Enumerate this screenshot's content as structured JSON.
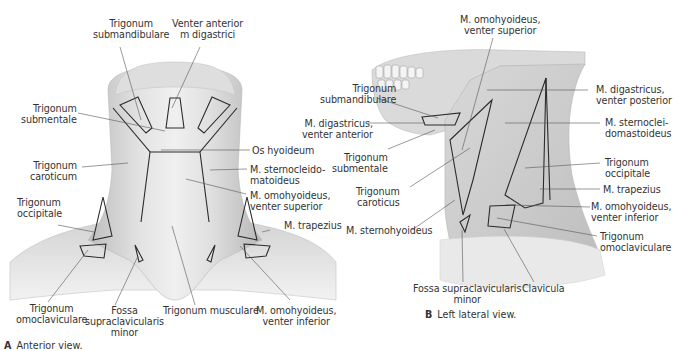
{
  "panel_a": {
    "caption_letter": "A",
    "caption_text": "Anterior view.",
    "labels": {
      "trig_submandibulare": "Trigonum\nsubmandibulare",
      "venter_anterior": "Venter anterior\nm digastrici",
      "trig_submentale": "Trigonum\nsubmentale",
      "os_hyoideum": "Os hyoideum",
      "trig_caroticum": "Trigonum\ncaroticum",
      "m_sternocleido": "M. sternocleido-\nmatoideus",
      "m_omohyoideus_sup": "M. omohyoideus,\nventer superior",
      "trig_occipitale": "Trigonum\noccipitale",
      "m_trapezius": "M. trapezius",
      "trig_omoclaviculare": "Trigonum\nomoclaviculare",
      "fossa_supraclav": "Fossa\nsupraclavicularis\nminor",
      "trig_musculare": "Trigonum musculare",
      "m_omohyoideus_inf": "M. omohyoideus,\nventer inferior"
    }
  },
  "panel_b": {
    "caption_letter": "B",
    "caption_text": "Left lateral view.",
    "labels": {
      "m_omohyoideus_sup": "M. omohyoideus,\nventer superior",
      "trig_submandibulare": "Trigonum\nsubmandibulare",
      "m_digastricus_ant": "M. digastricus,\nventer anterior",
      "trig_submentale": "Trigonum\nsubmentale",
      "trig_caroticus": "Trigonum\ncaroticus",
      "m_sternohyoideus": "M. sternohyoideus",
      "m_digastricus_post": "M. digastricus,\nventer posterior",
      "m_sternocleido": "M. sternoclei-\ndomastoideus",
      "trig_occipitale": "Trigonum\noccipitale",
      "m_trapezius": "M. trapezius",
      "m_omohyoideus_inf": "M. omohyoideus,\nventer inferior",
      "trig_omoclaviculare": "Trigonum\nomoclaviculare",
      "fossa_supraclav": "Fossa supraclavicularis\nminor",
      "clavicula": "Clavicula"
    }
  },
  "colors": {
    "tissue_light": "#e8e8e8",
    "tissue_mid": "#cfcfcf",
    "tissue_dark": "#a9a9a9",
    "outline": "#2b2b2b",
    "leader": "#555555"
  }
}
